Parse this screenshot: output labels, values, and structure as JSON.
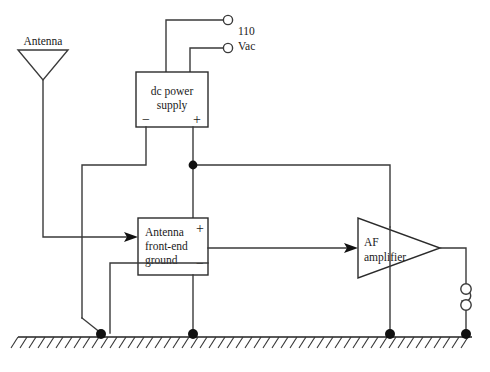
{
  "diagram": {
    "background_color": "#ffffff",
    "line_color": "#3a3a3a"
  },
  "antenna": {
    "label": "Antenna",
    "symbol": "antenna-triangle-icon"
  },
  "power_supply": {
    "line1": "dc power",
    "line2": "supply",
    "negative_terminal": "−",
    "positive_terminal": "+"
  },
  "mains": {
    "line1": "110",
    "line2": "Vac",
    "terminal_count": 2
  },
  "front_end": {
    "line1": "Antenna",
    "line2": "front-end",
    "line3": "ground",
    "positive_terminal": "+",
    "negative_terminal": "−"
  },
  "amplifier": {
    "line1": "AF",
    "line2": "amplifier",
    "symbol": "triangle-amplifier-icon"
  },
  "output": {
    "symbol": "transducer-icon",
    "terminal_count": 2
  },
  "ground": {
    "symbol": "ground-hatch-icon",
    "node_count": 4
  }
}
